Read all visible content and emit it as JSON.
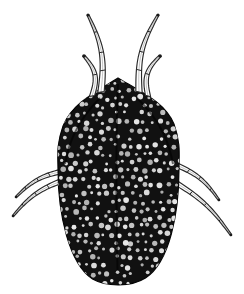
{
  "figure": {
    "kind": "scientific-line-illustration",
    "subject": "mite",
    "view": "dorsal",
    "background_color": "#ffffff",
    "ink_color": "#1a1a1a",
    "body_fill_color": "#111111",
    "punctation_color": "#e8e8e8",
    "outline_color": "#2a2a2a",
    "canvas": {
      "width": 244,
      "height": 294
    },
    "body": {
      "label": "idiosoma",
      "peak_x": 118,
      "peak_y": 78,
      "left_edge_x": 58,
      "right_edge_x": 179,
      "bottom_y": 284,
      "widest_y": 170,
      "punctation_count": 430,
      "punctation_min_radius": 1.4,
      "punctation_max_radius": 2.9,
      "punctation_spacing": 8
    },
    "appendages": [
      {
        "name": "leg-I-left",
        "side": "left",
        "position": "anterior",
        "segments": 4,
        "base_x": 101,
        "base_y": 92,
        "tip_x": 88,
        "tip_y": 15,
        "base_width": 6.5,
        "tip_width": 2.0
      },
      {
        "name": "palp-left",
        "side": "left",
        "position": "anterior",
        "segments": 2,
        "base_x": 92,
        "base_y": 96,
        "tip_x": 84,
        "tip_y": 56,
        "base_width": 5.5,
        "tip_width": 2.6
      },
      {
        "name": "leg-I-right",
        "side": "right",
        "position": "anterior",
        "segments": 4,
        "base_x": 139,
        "base_y": 92,
        "tip_x": 158,
        "tip_y": 15,
        "base_width": 6.5,
        "tip_width": 2.0
      },
      {
        "name": "palp-right",
        "side": "right",
        "position": "anterior",
        "segments": 2,
        "base_x": 148,
        "base_y": 96,
        "tip_x": 160,
        "tip_y": 56,
        "base_width": 5.5,
        "tip_width": 2.6
      },
      {
        "name": "leg-III-left",
        "side": "left",
        "position": "posterior",
        "segments": 4,
        "base_x": 64,
        "base_y": 171,
        "tip_x": 16,
        "tip_y": 197,
        "base_width": 5.0,
        "tip_width": 1.6
      },
      {
        "name": "leg-IV-left",
        "side": "left",
        "position": "posterior",
        "segments": 4,
        "base_x": 64,
        "base_y": 180,
        "tip_x": 13,
        "tip_y": 216,
        "base_width": 5.0,
        "tip_width": 1.6
      },
      {
        "name": "leg-III-right",
        "side": "right",
        "position": "posterior",
        "segments": 4,
        "base_x": 174,
        "base_y": 164,
        "tip_x": 219,
        "tip_y": 200,
        "base_width": 5.0,
        "tip_width": 1.6
      },
      {
        "name": "leg-IV-right",
        "side": "right",
        "position": "posterior",
        "segments": 4,
        "base_x": 173,
        "base_y": 181,
        "tip_x": 231,
        "tip_y": 235,
        "base_width": 5.0,
        "tip_width": 1.6
      }
    ]
  }
}
